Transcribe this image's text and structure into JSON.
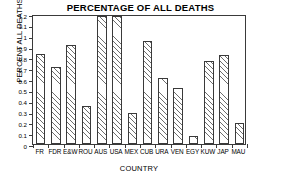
{
  "chart_data": {
    "type": "bar",
    "title": "PERCENTAGE OF ALL DEATHS",
    "xlabel": "COUNTRY",
    "ylabel": "PERCENT ALL DEATHS",
    "categories": [
      "FR",
      "FDR",
      "E&W",
      "ROU",
      "AUS",
      "USA",
      "MEX",
      "CUB",
      "URA",
      "VEN",
      "EGY",
      "KUW",
      "JAP",
      "MAU"
    ],
    "values": [
      0.83,
      0.71,
      0.91,
      0.355,
      1.185,
      1.18,
      0.29,
      0.955,
      0.61,
      0.515,
      0.075,
      0.77,
      0.825,
      0.19
    ],
    "ylim": [
      0,
      1.2
    ],
    "ytick_labels": [
      "0",
      "0.1",
      "0.2",
      "0.3",
      "0.4",
      "0.5",
      "0.6",
      "0.7",
      "0.8",
      "0.9",
      "1",
      "1.1",
      "1.2"
    ],
    "ytick_values": [
      0,
      0.1,
      0.2,
      0.3,
      0.4,
      0.5,
      0.6,
      0.7,
      0.8,
      0.9,
      1.0,
      1.1,
      1.2
    ],
    "grid": false,
    "legend": null,
    "bar_fill": "diagonal-hatch",
    "bar_edge_color": "#3a3a3a",
    "axis_color": "#3a3a3a",
    "background_color": "#ffffff"
  }
}
